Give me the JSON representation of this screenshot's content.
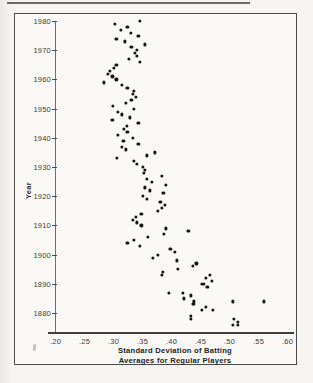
{
  "figure": {
    "ylabel": "Year",
    "xlabel_line1": "Standard Deviation of Batting",
    "xlabel_line2": "Averages for Regular Players"
  },
  "colors": {
    "ink": "#161616",
    "frame": "#4b4b4b",
    "paper": "#faf9f6",
    "label_text": "#3a3a3a"
  },
  "chart_data": {
    "type": "scatter",
    "title": "",
    "xlabel": "Standard Deviation of Batting Averages for Regular Players",
    "ylabel": "Year",
    "xlim": [
      0.2,
      0.6
    ],
    "ylim": [
      1876,
      1981
    ],
    "grid": false,
    "legend": "none",
    "x_ticks": [
      ".20",
      ".25",
      ".30",
      ".35",
      ".40",
      ".45",
      ".50",
      ".55",
      ".60"
    ],
    "x_tick_values": [
      0.2,
      0.25,
      0.3,
      0.35,
      0.4,
      0.45,
      0.5,
      0.55,
      0.6
    ],
    "y_ticks": [
      "1980",
      "1970",
      "1960",
      "1950",
      "1940",
      "1930",
      "1920",
      "1910",
      "1900",
      "1890",
      "1880"
    ],
    "y_tick_values": [
      1980,
      1970,
      1960,
      1950,
      1940,
      1930,
      1920,
      1910,
      1900,
      1890,
      1880
    ],
    "points": [
      [
        1980,
        0.345
      ],
      [
        1979,
        0.302
      ],
      [
        1978,
        0.324
      ],
      [
        1977,
        0.313
      ],
      [
        1976,
        0.33
      ],
      [
        1975,
        0.343
      ],
      [
        1974,
        0.305
      ],
      [
        1973,
        0.32
      ],
      [
        1972,
        0.354
      ],
      [
        1971,
        0.331
      ],
      [
        1970,
        0.34
      ],
      [
        1969,
        0.337
      ],
      [
        1968,
        0.341
      ],
      [
        1967,
        0.327
      ],
      [
        1966,
        0.345
      ],
      [
        1965,
        0.305
      ],
      [
        1964,
        0.301
      ],
      [
        1963,
        0.294
      ],
      [
        1962,
        0.291
      ],
      [
        1961,
        0.298
      ],
      [
        1960,
        0.305
      ],
      [
        1959,
        0.284
      ],
      [
        1958,
        0.314
      ],
      [
        1957,
        0.324
      ],
      [
        1956,
        0.335
      ],
      [
        1955,
        0.333
      ],
      [
        1954,
        0.339
      ],
      [
        1953,
        0.331
      ],
      [
        1952,
        0.322
      ],
      [
        1951,
        0.299
      ],
      [
        1950,
        0.335
      ],
      [
        1949,
        0.308
      ],
      [
        1948,
        0.314
      ],
      [
        1947,
        0.328
      ],
      [
        1946,
        0.298
      ],
      [
        1945,
        0.343
      ],
      [
        1944,
        0.323
      ],
      [
        1943,
        0.318
      ],
      [
        1942,
        0.324
      ],
      [
        1941,
        0.308
      ],
      [
        1940,
        0.333
      ],
      [
        1939,
        0.317
      ],
      [
        1938,
        0.343
      ],
      [
        1937,
        0.314
      ],
      [
        1936,
        0.321
      ],
      [
        1935,
        0.371
      ],
      [
        1934,
        0.357
      ],
      [
        1933,
        0.306
      ],
      [
        1932,
        0.335
      ],
      [
        1931,
        0.34
      ],
      [
        1930,
        0.351
      ],
      [
        1929,
        0.354
      ],
      [
        1928,
        0.352
      ],
      [
        1927,
        0.383
      ],
      [
        1926,
        0.357
      ],
      [
        1925,
        0.366
      ],
      [
        1924,
        0.391
      ],
      [
        1923,
        0.354
      ],
      [
        1922,
        0.363
      ],
      [
        1921,
        0.386
      ],
      [
        1920,
        0.351
      ],
      [
        1919,
        0.357
      ],
      [
        1918,
        0.381
      ],
      [
        1917,
        0.388
      ],
      [
        1916,
        0.384
      ],
      [
        1915,
        0.377
      ],
      [
        1914,
        0.348
      ],
      [
        1913,
        0.338
      ],
      [
        1912,
        0.333
      ],
      [
        1911,
        0.34
      ],
      [
        1910,
        0.348
      ],
      [
        1909,
        0.391
      ],
      [
        1908,
        0.429
      ],
      [
        1907,
        0.387
      ],
      [
        1906,
        0.36
      ],
      [
        1905,
        0.335
      ],
      [
        1904,
        0.324
      ],
      [
        1903,
        0.346
      ],
      [
        1902,
        0.398
      ],
      [
        1901,
        0.406
      ],
      [
        1900,
        0.377
      ],
      [
        1899,
        0.368
      ],
      [
        1898,
        0.409
      ],
      [
        1897,
        0.443
      ],
      [
        1896,
        0.437
      ],
      [
        1895,
        0.411
      ],
      [
        1894,
        0.385
      ],
      [
        1893,
        0.383
      ],
      [
        1893,
        0.466
      ],
      [
        1892,
        0.46
      ],
      [
        1891,
        0.469
      ],
      [
        1890,
        0.456
      ],
      [
        1890,
        0.453
      ],
      [
        1889,
        0.462
      ],
      [
        1887,
        0.419
      ],
      [
        1887,
        0.396
      ],
      [
        1886,
        0.433
      ],
      [
        1885,
        0.421
      ],
      [
        1884,
        0.439
      ],
      [
        1883,
        0.439
      ],
      [
        1883,
        0.437
      ],
      [
        1884,
        0.56
      ],
      [
        1884,
        0.506
      ],
      [
        1882,
        0.459
      ],
      [
        1881,
        0.453
      ],
      [
        1881,
        0.471
      ],
      [
        1879,
        0.433
      ],
      [
        1878,
        0.434
      ],
      [
        1878,
        0.508
      ],
      [
        1877,
        0.515
      ],
      [
        1876,
        0.514
      ],
      [
        1876,
        0.506
      ]
    ]
  }
}
